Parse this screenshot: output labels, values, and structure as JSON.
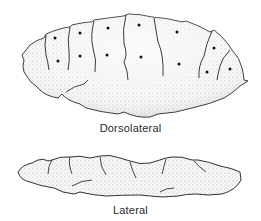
{
  "figure": {
    "views": [
      {
        "id": "dorsolateral",
        "label": "Dorsolateral"
      },
      {
        "id": "lateral",
        "label": "Lateral"
      }
    ],
    "colors": {
      "outline": "#1a1a1a",
      "stipple": "#9a9a9a",
      "fill": "#f4f4f4",
      "background": "#ffffff"
    }
  }
}
